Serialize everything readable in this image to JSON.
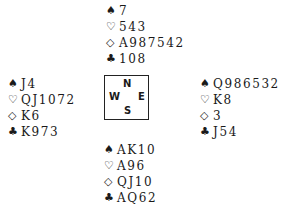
{
  "suits": {
    "spades": "♠",
    "hearts": "♡",
    "diamonds": "◇",
    "clubs": "♣"
  },
  "hands": {
    "north": {
      "spades": "7",
      "hearts": "543",
      "diamonds": "A987542",
      "clubs": "108"
    },
    "west": {
      "spades": "J4",
      "hearts": "QJ1072",
      "diamonds": "K6",
      "clubs": "K973"
    },
    "east": {
      "spades": "Q986532",
      "hearts": "K8",
      "diamonds": "3",
      "clubs": "J54"
    },
    "south": {
      "spades": "AK10",
      "hearts": "A96",
      "diamonds": "QJ10",
      "clubs": "AQ62"
    }
  },
  "compass": {
    "n": "N",
    "s": "S",
    "w": "W",
    "e": "E"
  }
}
